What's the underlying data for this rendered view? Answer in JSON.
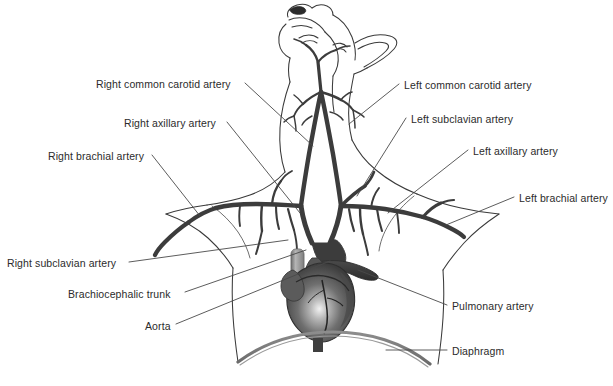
{
  "figure": {
    "background_color": "#ffffff",
    "text_color": "#2b2b2b",
    "leader_line_color": "#4a4a4a",
    "artery_color": "#3c3c3c",
    "outline_color": "#3a3a3a",
    "heart_color": "#4c4c4c",
    "diaphragm_color": "#777777",
    "pulmonary_tube_color": "#8a8a8a"
  },
  "labels": {
    "right_common_carotid": {
      "text": "Right common carotid artery",
      "x": 96,
      "y": 78,
      "align": "left"
    },
    "right_axillary": {
      "text": "Right axillary artery",
      "x": 124,
      "y": 117,
      "align": "left"
    },
    "right_brachial": {
      "text": "Right brachial artery",
      "x": 48,
      "y": 150,
      "align": "left"
    },
    "right_subclavian": {
      "text": "Right subclavian artery",
      "x": 7,
      "y": 257,
      "align": "left"
    },
    "brachiocephalic_trunk": {
      "text": "Brachiocephalic trunk",
      "x": 68,
      "y": 288,
      "align": "left"
    },
    "aorta": {
      "text": "Aorta",
      "x": 145,
      "y": 320,
      "align": "left"
    },
    "left_common_carotid": {
      "text": "Left common carotid artery",
      "x": 404,
      "y": 79,
      "align": "left"
    },
    "left_subclavian": {
      "text": "Left subclavian artery",
      "x": 411,
      "y": 113,
      "align": "left"
    },
    "left_axillary": {
      "text": "Left axillary artery",
      "x": 473,
      "y": 145,
      "align": "left"
    },
    "left_brachial": {
      "text": "Left brachial artery",
      "x": 519,
      "y": 192,
      "align": "left"
    },
    "pulmonary_artery": {
      "text": "Pulmonary artery",
      "x": 452,
      "y": 300,
      "align": "left"
    },
    "diaphragm": {
      "text": "Diaphragm",
      "x": 452,
      "y": 345,
      "align": "left"
    }
  }
}
